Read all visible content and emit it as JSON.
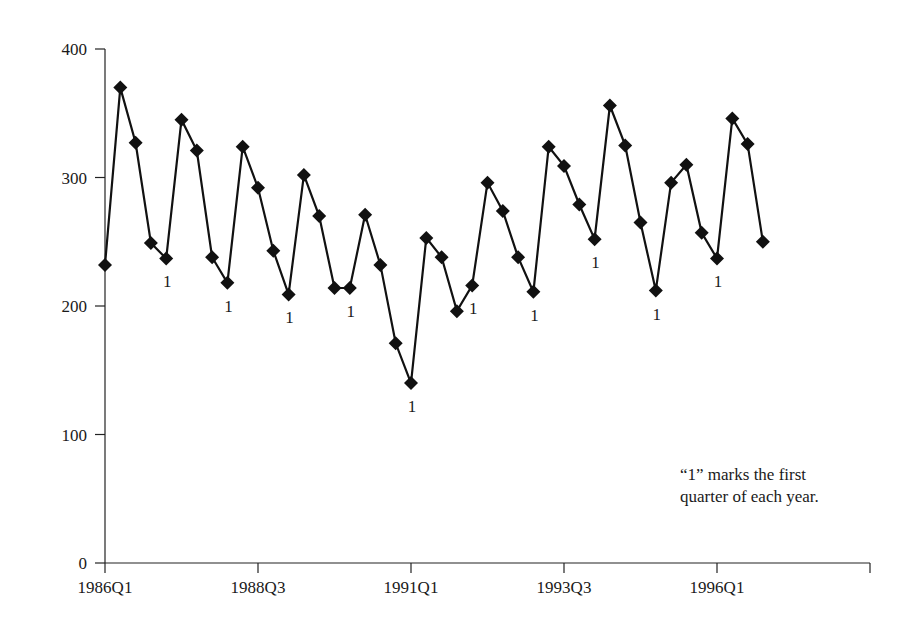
{
  "chart_data": {
    "type": "line",
    "title": "",
    "xlabel": "",
    "ylabel": "",
    "ylim": [
      0,
      400
    ],
    "yticks": [
      0,
      100,
      200,
      300,
      400
    ],
    "xtick_labels": [
      "1986Q1",
      "1988Q3",
      "1991Q1",
      "1993Q3",
      "1996Q1",
      ""
    ],
    "grid": false,
    "legend": null,
    "marker": "diamond",
    "line_color": "#111111",
    "annotation": {
      "line1": "“1” marks the first",
      "line2": "quarter of each year."
    },
    "q1_marker_label": "1",
    "x": [
      "1986Q1",
      "1986Q2",
      "1986Q3",
      "1986Q4",
      "1987Q1",
      "1987Q2",
      "1987Q3",
      "1987Q4",
      "1988Q1",
      "1988Q2",
      "1988Q3",
      "1988Q4",
      "1989Q1",
      "1989Q2",
      "1989Q3",
      "1989Q4",
      "1990Q1",
      "1990Q2",
      "1990Q3",
      "1990Q4",
      "1991Q1",
      "1991Q2",
      "1991Q3",
      "1991Q4",
      "1992Q1",
      "1992Q2",
      "1992Q3",
      "1992Q4",
      "1993Q1",
      "1993Q2",
      "1993Q3",
      "1993Q4",
      "1994Q1",
      "1994Q2",
      "1994Q3",
      "1994Q4",
      "1995Q1",
      "1995Q2",
      "1995Q3",
      "1995Q4",
      "1996Q1",
      "1996Q2",
      "1996Q3",
      "1996Q4"
    ],
    "values": [
      232,
      370,
      327,
      249,
      237,
      345,
      321,
      238,
      218,
      324,
      292,
      243,
      209,
      302,
      270,
      214,
      214,
      271,
      232,
      171,
      140,
      253,
      238,
      196,
      216,
      296,
      274,
      238,
      211,
      324,
      309,
      279,
      252,
      356,
      325,
      265,
      212,
      296,
      310,
      257,
      237,
      346,
      326,
      250
    ]
  }
}
